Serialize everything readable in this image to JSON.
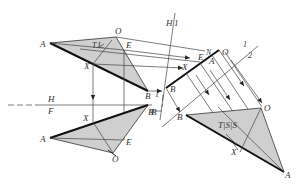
{
  "diagram": {
    "title": "",
    "colors": {
      "fill": "#cfcfcf",
      "line": "#333333",
      "edge": "#111111"
    },
    "top_view": {
      "labels": {
        "A": "A",
        "O": "O",
        "E": "E",
        "X": "X",
        "B": "B",
        "TL": "T.L."
      }
    },
    "front_view": {
      "labels": {
        "A": "A",
        "O": "O",
        "E": "E",
        "X": "X",
        "B": "B"
      }
    },
    "edge_view": {
      "labels": {
        "B": "B",
        "X": "X",
        "E": "E",
        "N": "N",
        "A": "A",
        "O": "O"
      }
    },
    "true_size_view": {
      "labels": {
        "B": "B",
        "O": "O",
        "X": "X",
        "A": "A",
        "TSS": "T|S|S"
      }
    },
    "fold_lines": {
      "H_F": {
        "top": "H",
        "bottom": "F"
      },
      "H_1": {
        "left": "H",
        "right": "1"
      },
      "one_two": {
        "top": "1",
        "bottom": "2"
      }
    },
    "extra_labels": {
      "B_foldH1": "B",
      "B_fold12": "B",
      "one_mark": "1"
    }
  }
}
